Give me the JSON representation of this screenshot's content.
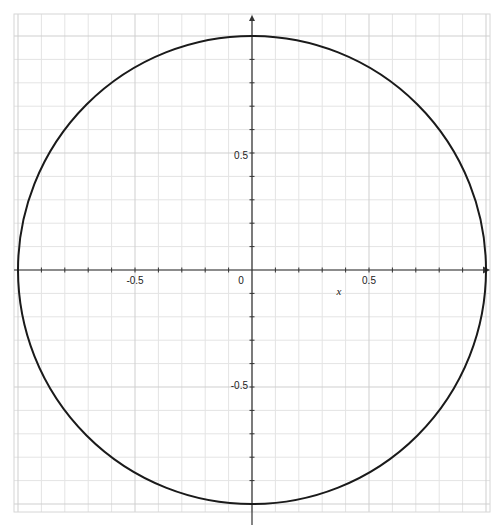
{
  "chart_data": {
    "type": "line",
    "title": "",
    "xlabel": "x",
    "ylabel": "",
    "xlim": [
      -1.0,
      1.0
    ],
    "ylim": [
      -1.0,
      1.0
    ],
    "grid": true,
    "minor_grid_step": 0.1,
    "major_grid_step": 0.5,
    "x_tick_labels": [
      "-0.5",
      "0",
      "0.5"
    ],
    "y_tick_labels": [
      "0.5",
      "-0.5"
    ],
    "x_ticks": [
      -0.5,
      0,
      0.5
    ],
    "y_ticks": [
      0.5,
      -0.5
    ],
    "series": [
      {
        "name": "circle",
        "kind": "parametric",
        "center": [
          0,
          0
        ],
        "radius": 1,
        "color": "#1a1a1a",
        "points_sample": [
          [
            1,
            0
          ],
          [
            0.707,
            0.707
          ],
          [
            0,
            1
          ],
          [
            -0.707,
            0.707
          ],
          [
            -1,
            0
          ],
          [
            -0.707,
            -0.707
          ],
          [
            0,
            -1
          ],
          [
            0.707,
            -0.707
          ]
        ]
      }
    ],
    "legend": null
  },
  "labels": {
    "x_neg_half": "-0.5",
    "x_zero": "0",
    "x_pos_half": "0.5",
    "x_axis_title": "x",
    "y_pos_half": "0.5",
    "y_neg_half": "-0.5"
  },
  "colors": {
    "background": "#ffffff",
    "grid_minor": "#e4e4e4",
    "grid_major": "#cfcfcf",
    "axis": "#333333",
    "curve": "#1a1a1a"
  }
}
